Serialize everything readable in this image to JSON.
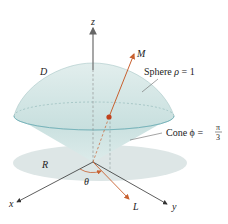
{
  "diagram": {
    "title": "",
    "labels": {
      "z_axis": "z",
      "x_axis": "x",
      "y_axis": "y",
      "region_D": "D",
      "region_R": "R",
      "point_M": "M",
      "point_L": "L",
      "angle_theta": "θ",
      "sphere_prefix": "Sphere ",
      "sphere_var": "ρ",
      "sphere_eq": " = 1",
      "cone_prefix": "Cone ",
      "cone_var": "ϕ",
      "cone_eq": " = ",
      "cone_num": "π",
      "cone_den": "3"
    },
    "colors": {
      "solid_fill": "#cfe3e2",
      "solid_edge": "#7fb3b6",
      "shadow_fill": "#dde6e6",
      "axis": "#333333",
      "z_axis": "#777777",
      "ray": "#c8602f",
      "point": "#c0401c",
      "leader": "#666666"
    }
  }
}
